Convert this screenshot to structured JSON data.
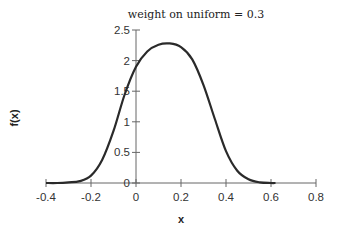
{
  "chart_data": {
    "type": "line",
    "title": "weight on uniform = 0.3",
    "xlabel": "x",
    "ylabel": "f(x)",
    "xlim": [
      -0.4,
      0.8
    ],
    "ylim": [
      0,
      2.5
    ],
    "grid": false,
    "legend": null,
    "x_ticks": [
      -0.4,
      -0.2,
      0,
      0.2,
      0.4,
      0.6,
      0.8
    ],
    "x_tick_labels": [
      "-0.4",
      "-0.2",
      "0",
      "0.2",
      "0.4",
      "0.6",
      "0.8"
    ],
    "y_ticks": [
      0,
      0.5,
      1,
      1.5,
      2,
      2.5
    ],
    "y_tick_labels": [
      "0",
      "0.5",
      "1",
      "1.5",
      "2",
      "2.5"
    ],
    "series": [
      {
        "name": "f(x)",
        "color": "#2a2a2a",
        "x": [
          -0.4,
          -0.35,
          -0.3,
          -0.25,
          -0.2,
          -0.15,
          -0.1,
          -0.05,
          0,
          0.05,
          0.1,
          0.15,
          0.2,
          0.25,
          0.3,
          0.35,
          0.4,
          0.45,
          0.5,
          0.55,
          0.6,
          0.62
        ],
        "y": [
          0.0,
          0.0,
          0.01,
          0.03,
          0.12,
          0.38,
          0.85,
          1.45,
          1.9,
          2.15,
          2.26,
          2.28,
          2.22,
          2.02,
          1.6,
          1.05,
          0.52,
          0.2,
          0.06,
          0.01,
          0.0,
          0.0
        ]
      }
    ]
  }
}
